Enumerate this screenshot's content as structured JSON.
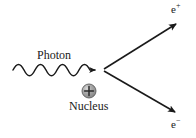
{
  "diagram": {
    "background_color": "#ffffff",
    "stroke_color": "#1a1a1a",
    "labels": {
      "photon": "Photon",
      "nucleus": "Nucleus",
      "positron_base": "e",
      "positron_charge": "+",
      "electron_base": "e",
      "electron_charge": "−"
    },
    "nucleus": {
      "charge_sign": "+",
      "fill_color": "#9a9a9a",
      "highlight_color": "#d8d8d8",
      "edge_color": "#4a4a4a",
      "center_x": 89,
      "center_y": 91,
      "radius": 7
    },
    "photon_wave": {
      "start_x": 13,
      "end_x": 101,
      "center_y": 70,
      "amplitude": 4,
      "periods": 6
    },
    "vertex": {
      "x": 103,
      "y": 70
    },
    "positron_track": {
      "from_x": 104,
      "from_y": 69,
      "to_x": 179,
      "to_y": 22
    },
    "electron_track": {
      "from_x": 104,
      "from_y": 71,
      "to_x": 178,
      "to_y": 114
    }
  }
}
